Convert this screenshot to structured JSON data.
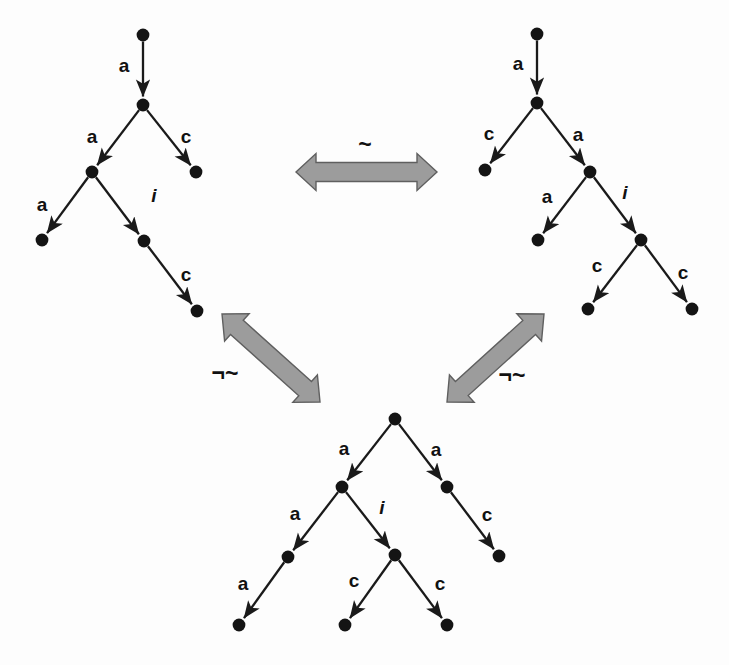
{
  "figure": {
    "background_color": "#fdfdfd",
    "node_color": "#141414",
    "edge_color": "#1a1a1a",
    "arrow_fill_color": "#9c9c9c",
    "arrow_stroke_color": "#5f5f5f"
  },
  "trees": [
    {
      "id": "tree-top-left",
      "name": "top-left-tree",
      "nodes": [
        {
          "id": "tl0",
          "x": 143,
          "y": 35
        },
        {
          "id": "tl1",
          "x": 143,
          "y": 105
        },
        {
          "id": "tl2",
          "x": 92,
          "y": 172
        },
        {
          "id": "tl3",
          "x": 196,
          "y": 172
        },
        {
          "id": "tl4",
          "x": 42,
          "y": 240
        },
        {
          "id": "tl5",
          "x": 144,
          "y": 241
        },
        {
          "id": "tl6",
          "x": 197,
          "y": 311
        }
      ],
      "edges": [
        {
          "from": "tl0",
          "to": "tl1",
          "label": "a",
          "italic": false,
          "lx": 124,
          "ly": 72
        },
        {
          "from": "tl1",
          "to": "tl2",
          "label": "a",
          "italic": false,
          "lx": 92,
          "ly": 143
        },
        {
          "from": "tl1",
          "to": "tl3",
          "label": "c",
          "italic": false,
          "lx": 186,
          "ly": 143
        },
        {
          "from": "tl2",
          "to": "tl4",
          "label": "a",
          "italic": false,
          "lx": 42,
          "ly": 211
        },
        {
          "from": "tl2",
          "to": "tl5",
          "label": "i",
          "italic": true,
          "lx": 154,
          "ly": 202
        },
        {
          "from": "tl5",
          "to": "tl6",
          "label": "c",
          "italic": false,
          "lx": 186,
          "ly": 281
        }
      ]
    },
    {
      "id": "tree-top-right",
      "name": "top-right-tree",
      "nodes": [
        {
          "id": "tr0",
          "x": 537,
          "y": 34
        },
        {
          "id": "tr1",
          "x": 537,
          "y": 103
        },
        {
          "id": "tr2",
          "x": 485,
          "y": 170
        },
        {
          "id": "tr3",
          "x": 590,
          "y": 172
        },
        {
          "id": "tr4",
          "x": 538,
          "y": 240
        },
        {
          "id": "tr5",
          "x": 641,
          "y": 240
        },
        {
          "id": "tr6",
          "x": 588,
          "y": 309
        },
        {
          "id": "tr7",
          "x": 692,
          "y": 309
        }
      ],
      "edges": [
        {
          "from": "tr0",
          "to": "tr1",
          "label": "a",
          "italic": false,
          "lx": 518,
          "ly": 70
        },
        {
          "from": "tr1",
          "to": "tr2",
          "label": "c",
          "italic": false,
          "lx": 489,
          "ly": 140
        },
        {
          "from": "tr1",
          "to": "tr3",
          "label": "a",
          "italic": false,
          "lx": 578,
          "ly": 141
        },
        {
          "from": "tr3",
          "to": "tr4",
          "label": "a",
          "italic": false,
          "lx": 547,
          "ly": 203
        },
        {
          "from": "tr3",
          "to": "tr5",
          "label": "i",
          "italic": true,
          "lx": 625,
          "ly": 199
        },
        {
          "from": "tr5",
          "to": "tr6",
          "label": "c",
          "italic": false,
          "lx": 597,
          "ly": 272
        },
        {
          "from": "tr5",
          "to": "tr7",
          "label": "c",
          "italic": false,
          "lx": 683,
          "ly": 279
        }
      ]
    },
    {
      "id": "tree-bottom",
      "name": "bottom-tree",
      "nodes": [
        {
          "id": "b0",
          "x": 395,
          "y": 419
        },
        {
          "id": "b1",
          "x": 342,
          "y": 487
        },
        {
          "id": "b2",
          "x": 447,
          "y": 487
        },
        {
          "id": "b3",
          "x": 288,
          "y": 557
        },
        {
          "id": "b4",
          "x": 395,
          "y": 555
        },
        {
          "id": "b5",
          "x": 499,
          "y": 556
        },
        {
          "id": "b6",
          "x": 239,
          "y": 625
        },
        {
          "id": "b7",
          "x": 345,
          "y": 625
        },
        {
          "id": "b8",
          "x": 447,
          "y": 625
        }
      ],
      "edges": [
        {
          "from": "b0",
          "to": "b1",
          "label": "a",
          "italic": false,
          "lx": 344,
          "ly": 455
        },
        {
          "from": "b0",
          "to": "b2",
          "label": "a",
          "italic": false,
          "lx": 436,
          "ly": 456
        },
        {
          "from": "b1",
          "to": "b3",
          "label": "a",
          "italic": false,
          "lx": 295,
          "ly": 520
        },
        {
          "from": "b1",
          "to": "b4",
          "label": "i",
          "italic": true,
          "lx": 382,
          "ly": 514
        },
        {
          "from": "b2",
          "to": "b5",
          "label": "c",
          "italic": false,
          "lx": 487,
          "ly": 521
        },
        {
          "from": "b3",
          "to": "b6",
          "label": "a",
          "italic": false,
          "lx": 243,
          "ly": 590
        },
        {
          "from": "b4",
          "to": "b7",
          "label": "c",
          "italic": false,
          "lx": 354,
          "ly": 587
        },
        {
          "from": "b4",
          "to": "b8",
          "label": "c",
          "italic": false,
          "lx": 440,
          "ly": 590
        }
      ]
    }
  ],
  "relations": [
    {
      "id": "rel-top",
      "name": "equivalence-arrow-top",
      "symbol": "~",
      "meaning": "bisimilar",
      "label_x": 365,
      "label_y": 152,
      "arrow": {
        "x1": 296,
        "y1": 172,
        "x2": 437,
        "y2": 172,
        "thickness": 19,
        "head": 20
      }
    },
    {
      "id": "rel-left",
      "name": "non-equivalence-arrow-left",
      "symbol": "¬~",
      "meaning": "not bisimilar",
      "label_x": 225,
      "label_y": 381,
      "arrow": {
        "x1": 222,
        "y1": 314,
        "x2": 320,
        "y2": 402,
        "thickness": 19,
        "head": 20
      }
    },
    {
      "id": "rel-right",
      "name": "non-equivalence-arrow-right",
      "symbol": "¬~",
      "meaning": "not bisimilar",
      "label_x": 512,
      "label_y": 383,
      "arrow": {
        "x1": 447,
        "y1": 402,
        "x2": 544,
        "y2": 314,
        "thickness": 19,
        "head": 20
      }
    }
  ]
}
